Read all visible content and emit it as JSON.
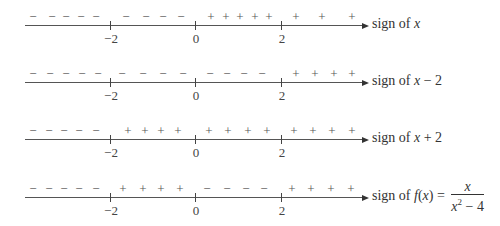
{
  "axis": {
    "ticks": [
      {
        "value": -2,
        "label": "−2",
        "x": 110
      },
      {
        "value": 0,
        "label": "0",
        "x": 195
      },
      {
        "value": 2,
        "label": "2",
        "x": 281
      }
    ]
  },
  "rows": [
    {
      "id": "x",
      "label_prefix": "sign of ",
      "label_var": "x",
      "label_suffix": "",
      "symbols": [
        {
          "s": "−",
          "x": 33
        },
        {
          "s": "−",
          "x": 52
        },
        {
          "s": "−",
          "x": 66
        },
        {
          "s": "−",
          "x": 81
        },
        {
          "s": "−",
          "x": 96
        },
        {
          "s": "−",
          "x": 126
        },
        {
          "s": "−",
          "x": 146
        },
        {
          "s": "−",
          "x": 163
        },
        {
          "s": "−",
          "x": 181
        },
        {
          "s": "+",
          "x": 211
        },
        {
          "s": "+",
          "x": 226
        },
        {
          "s": "+",
          "x": 240
        },
        {
          "s": "+",
          "x": 255
        },
        {
          "s": "+",
          "x": 269
        },
        {
          "s": "+",
          "x": 296
        },
        {
          "s": "+",
          "x": 322
        },
        {
          "s": "+",
          "x": 352
        }
      ]
    },
    {
      "id": "x-2",
      "label_prefix": "sign of ",
      "label_var": "x",
      "label_suffix": " − 2",
      "symbols": [
        {
          "s": "−",
          "x": 33
        },
        {
          "s": "−",
          "x": 50
        },
        {
          "s": "−",
          "x": 66
        },
        {
          "s": "−",
          "x": 82
        },
        {
          "s": "−",
          "x": 98
        },
        {
          "s": "−",
          "x": 122
        },
        {
          "s": "−",
          "x": 143
        },
        {
          "s": "−",
          "x": 163
        },
        {
          "s": "−",
          "x": 183
        },
        {
          "s": "−",
          "x": 210
        },
        {
          "s": "−",
          "x": 227
        },
        {
          "s": "−",
          "x": 244
        },
        {
          "s": "−",
          "x": 262
        },
        {
          "s": "+",
          "x": 296
        },
        {
          "s": "+",
          "x": 315
        },
        {
          "s": "+",
          "x": 334
        },
        {
          "s": "+",
          "x": 352
        }
      ]
    },
    {
      "id": "x+2",
      "label_prefix": "sign of ",
      "label_var": "x",
      "label_suffix": " + 2",
      "symbols": [
        {
          "s": "−",
          "x": 33
        },
        {
          "s": "−",
          "x": 49
        },
        {
          "s": "−",
          "x": 64
        },
        {
          "s": "−",
          "x": 79
        },
        {
          "s": "−",
          "x": 96
        },
        {
          "s": "+",
          "x": 128
        },
        {
          "s": "+",
          "x": 145
        },
        {
          "s": "+",
          "x": 161
        },
        {
          "s": "+",
          "x": 178
        },
        {
          "s": "+",
          "x": 209
        },
        {
          "s": "+",
          "x": 228
        },
        {
          "s": "+",
          "x": 248
        },
        {
          "s": "+",
          "x": 267
        },
        {
          "s": "+",
          "x": 294
        },
        {
          "s": "+",
          "x": 313
        },
        {
          "s": "+",
          "x": 332
        },
        {
          "s": "+",
          "x": 352
        }
      ]
    },
    {
      "id": "f",
      "label_prefix": "sign of ",
      "label_var": "f",
      "label_suffix": "(x) = ",
      "fraction": {
        "numerator": "x",
        "denominator_base": "x",
        "denominator_exp": "2",
        "denominator_tail": " − 4"
      },
      "symbols": [
        {
          "s": "−",
          "x": 33
        },
        {
          "s": "−",
          "x": 49
        },
        {
          "s": "−",
          "x": 64
        },
        {
          "s": "−",
          "x": 79
        },
        {
          "s": "−",
          "x": 96
        },
        {
          "s": "+",
          "x": 123
        },
        {
          "s": "+",
          "x": 143
        },
        {
          "s": "+",
          "x": 161
        },
        {
          "s": "+",
          "x": 180
        },
        {
          "s": "−",
          "x": 207
        },
        {
          "s": "−",
          "x": 227
        },
        {
          "s": "−",
          "x": 246
        },
        {
          "s": "−",
          "x": 264
        },
        {
          "s": "+",
          "x": 292
        },
        {
          "s": "+",
          "x": 311
        },
        {
          "s": "+",
          "x": 331
        },
        {
          "s": "+",
          "x": 351
        }
      ]
    }
  ],
  "layout": {
    "axis_y": [
      25,
      82,
      139,
      197
    ],
    "symbol_y_offset": -15,
    "axis_left": 25,
    "axis_right": 362,
    "label_x": 372
  }
}
